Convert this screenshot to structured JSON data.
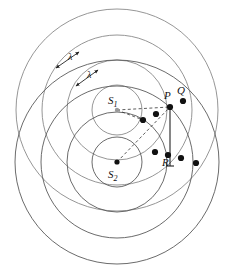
{
  "figure": {
    "type": "wave-interference-diagram",
    "background": "#ffffff",
    "width": 230,
    "height": 275
  },
  "style": {
    "wavefront_color_s1": "#8a8a8a",
    "wavefront_color_s2": "#5a5a5a",
    "dot_color": "#111111",
    "dash_color": "#333333",
    "label_color": "#111111",
    "wavefront_width": 0.9,
    "dot_radius": 3.1
  },
  "sources": [
    {
      "id": "S1",
      "label": "S",
      "subscript": "1",
      "cx": 117,
      "cy": 110,
      "label_x": 108,
      "label_y": 104,
      "dot_r": 2.2,
      "dot_color": "#9a9a9a"
    },
    {
      "id": "S2",
      "label": "S",
      "subscript": "2",
      "cx": 117,
      "cy": 162,
      "label_x": 108,
      "label_y": 178,
      "dot_r": 2.6,
      "dot_color": "#111111"
    }
  ],
  "wavefronts": {
    "s1_radii": [
      25,
      50,
      75,
      101
    ],
    "s2_radii": [
      25,
      50,
      76,
      102
    ],
    "note": "concentric circular wavefronts, spacing = one wavelength"
  },
  "points": [
    {
      "id": "P",
      "label": "P",
      "x": 170,
      "y": 107,
      "label_x": 164,
      "label_y": 99,
      "marked": true
    },
    {
      "id": "Q",
      "label": "Q",
      "x": 183,
      "y": 101,
      "label_x": 177,
      "label_y": 94,
      "marked": true
    },
    {
      "id": "R",
      "label": "R",
      "x": 168,
      "y": 155,
      "label_x": 162,
      "label_y": 166,
      "marked": true
    }
  ],
  "intersection_dots": [
    {
      "x": 170,
      "y": 107
    },
    {
      "x": 183,
      "y": 101
    },
    {
      "x": 156,
      "y": 114
    },
    {
      "x": 143,
      "y": 120
    },
    {
      "x": 155,
      "y": 152
    },
    {
      "x": 168,
      "y": 155
    },
    {
      "x": 181,
      "y": 158
    },
    {
      "x": 196,
      "y": 163
    }
  ],
  "wavelength_markers": [
    {
      "label": "λ",
      "label_x": 68,
      "label_y": 60,
      "x1": 56,
      "y1": 68,
      "x2": 79,
      "y2": 52
    },
    {
      "label": "λ",
      "label_x": 87,
      "label_y": 78,
      "x1": 76,
      "y1": 86,
      "x2": 98,
      "y2": 70
    }
  ],
  "path_lines": [
    {
      "from": "S1",
      "to": "P",
      "x1": 117,
      "y1": 110,
      "x2": 170,
      "y2": 107,
      "style": "dashed"
    },
    {
      "from": "S2",
      "to": "P",
      "x1": 117,
      "y1": 162,
      "x2": 170,
      "y2": 107,
      "style": "dashed"
    },
    {
      "from": "S1",
      "to": "lower-left",
      "x1": 117,
      "y1": 110,
      "x2": 143,
      "y2": 120,
      "style": "dashed"
    }
  ],
  "bracket": {
    "x": 170,
    "y_top": 107,
    "y_bottom": 166,
    "description": "vertical tick from P down past R"
  },
  "labels": {
    "s1": "S",
    "s1_sub": "1",
    "s2": "S",
    "s2_sub": "2",
    "p": "P",
    "q": "Q",
    "r": "R",
    "lambda1": "λ",
    "lambda2": "λ"
  }
}
